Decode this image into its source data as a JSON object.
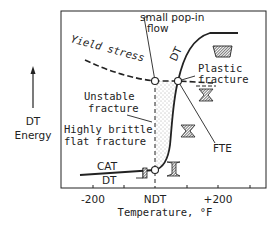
{
  "diagram": {
    "y_axis": {
      "label_line1": "DT",
      "label_line2": "Energy"
    },
    "x_axis": {
      "label": "Temperature, °F",
      "ticks": [
        "-200",
        "NDT",
        "+200"
      ]
    },
    "annotations": {
      "yield_stress": "Yield stress",
      "small_popin_line1": "small pop-in",
      "small_popin_line2": "flow",
      "dt_curve": "DT",
      "plastic_line1": "Plastic",
      "plastic_line2": "fracture",
      "unstable_line1": "Unstable",
      "unstable_line2": "fracture",
      "brittle_line1": "Highly brittle",
      "brittle_line2": "flat fracture",
      "cat": "CAT",
      "dt_low": "DT",
      "fte": "FTE"
    },
    "colors": {
      "ink": "#222222",
      "background": "#ffffff"
    }
  }
}
